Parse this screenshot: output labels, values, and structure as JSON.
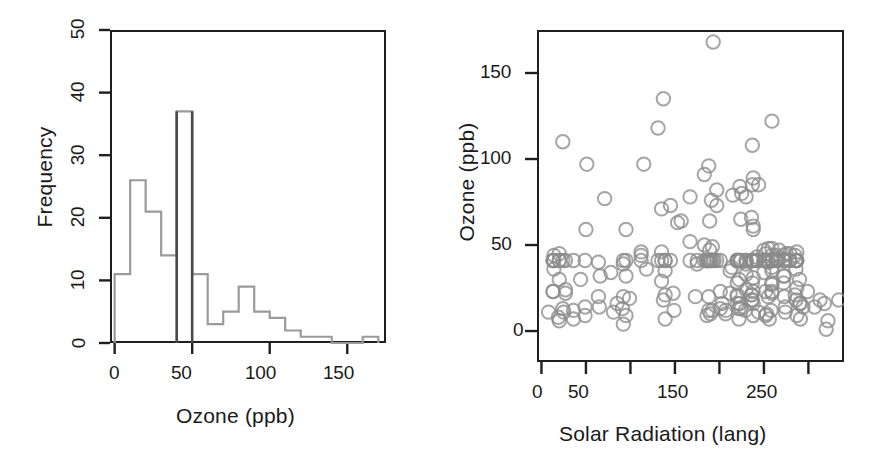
{
  "figure": {
    "width": 882,
    "height": 463,
    "background": "#ffffff",
    "panel_count": 2,
    "colors": {
      "frame": "#1f1f1f",
      "histogram_outline": "#9a9a9a",
      "histogram_highlight": "#4a4a4a",
      "scatter_point": "#8c8c8c",
      "text": "#1a1a1a"
    }
  },
  "panels": [
    {
      "id": "histogram",
      "position": "left"
    },
    {
      "id": "scatter",
      "position": "right"
    }
  ],
  "chart_data": [
    {
      "type": "bar",
      "id": "histogram",
      "title": "",
      "xlabel": "Ozone (ppb)",
      "ylabel": "Frequency",
      "xlim": [
        -3,
        175
      ],
      "ylim": [
        0,
        50
      ],
      "xticks": [
        0,
        50,
        100,
        150
      ],
      "xtick_labels": [
        "0",
        "50",
        "100",
        "150"
      ],
      "yticks": [
        0,
        10,
        20,
        30,
        40,
        50
      ],
      "ytick_labels": [
        "0",
        "10",
        "20",
        "30",
        "40",
        "50"
      ],
      "grid": false,
      "legend": "none",
      "bin_width": 10,
      "bin_edges": [
        0,
        10,
        20,
        30,
        40,
        50,
        60,
        70,
        80,
        90,
        100,
        110,
        120,
        130,
        140,
        150,
        160,
        170
      ],
      "categories": [
        "0-10",
        "10-20",
        "20-30",
        "30-40",
        "40-50",
        "50-60",
        "60-70",
        "70-80",
        "80-90",
        "90-100",
        "100-110",
        "110-120",
        "120-130",
        "130-140",
        "140-150",
        "150-160",
        "160-170"
      ],
      "values": [
        11,
        26,
        21,
        14,
        37,
        11,
        3,
        5,
        9,
        5,
        4,
        2,
        1,
        1,
        0,
        0,
        1
      ],
      "highlight_edges": [
        40,
        50
      ],
      "note": "Bin 40-50 drawn with darker outline (imputed mean bin)"
    },
    {
      "type": "scatter",
      "id": "scatter",
      "title": "",
      "xlabel": "Solar Radiation (lang)",
      "ylabel": "Ozone (ppb)",
      "xlim": [
        -5,
        340
      ],
      "ylim": [
        -18,
        175
      ],
      "xticks": [
        0,
        50,
        100,
        150,
        200,
        250,
        300
      ],
      "xtick_labels": [
        "0",
        "50",
        "",
        "150",
        "",
        "250",
        ""
      ],
      "yticks": [
        0,
        50,
        100,
        150
      ],
      "ytick_labels": [
        "0",
        "50",
        "100",
        "150"
      ],
      "grid": false,
      "legend": "none",
      "marker": "open-circle",
      "marker_size": 9,
      "points": [
        [
          190,
          41
        ],
        [
          118,
          36
        ],
        [
          149,
          12
        ],
        [
          313,
          18
        ],
        [
          186,
          41
        ],
        [
          220,
          28
        ],
        [
          299,
          23
        ],
        [
          99,
          19
        ],
        [
          19,
          8
        ],
        [
          194,
          41
        ],
        [
          256,
          7
        ],
        [
          290,
          16
        ],
        [
          274,
          11
        ],
        [
          65,
          14
        ],
        [
          334,
          18
        ],
        [
          307,
          14
        ],
        [
          78,
          34
        ],
        [
          322,
          6
        ],
        [
          44,
          30
        ],
        [
          8,
          11
        ],
        [
          320,
          1
        ],
        [
          25,
          11
        ],
        [
          92,
          4
        ],
        [
          66,
          32
        ],
        [
          266,
          41
        ],
        [
          13,
          23
        ],
        [
          252,
          45
        ],
        [
          223,
          41
        ],
        [
          279,
          41
        ],
        [
          286,
          41
        ],
        [
          287,
          41
        ],
        [
          242,
          41
        ],
        [
          186,
          41
        ],
        [
          220,
          41
        ],
        [
          264,
          41
        ],
        [
          273,
          41
        ],
        [
          286,
          41
        ],
        [
          242,
          41
        ],
        [
          186,
          41
        ],
        [
          220,
          41
        ],
        [
          13,
          41
        ],
        [
          252,
          41
        ],
        [
          223,
          41
        ],
        [
          279,
          41
        ],
        [
          286,
          41
        ],
        [
          287,
          41
        ],
        [
          242,
          41
        ],
        [
          186,
          41
        ],
        [
          220,
          41
        ],
        [
          264,
          41
        ],
        [
          273,
          41
        ],
        [
          135,
          41
        ],
        [
          13,
          41
        ],
        [
          36,
          41
        ],
        [
          255,
          41
        ],
        [
          175,
          41
        ],
        [
          139,
          41
        ],
        [
          20,
          41
        ],
        [
          259,
          41
        ],
        [
          250,
          41
        ],
        [
          135,
          29
        ],
        [
          230,
          41
        ],
        [
          259,
          41
        ],
        [
          250,
          41
        ],
        [
          135,
          71
        ],
        [
          230,
          39
        ],
        [
          259,
          23
        ],
        [
          236,
          21
        ],
        [
          259,
          37
        ],
        [
          255,
          20
        ],
        [
          207,
          12
        ],
        [
          222,
          13
        ],
        [
          137,
          135
        ],
        [
          192,
          49
        ],
        [
          273,
          32
        ],
        [
          157,
          64
        ],
        [
          64,
          40
        ],
        [
          71,
          77
        ],
        [
          51,
          97
        ],
        [
          115,
          97
        ],
        [
          244,
          85
        ],
        [
          190,
          10
        ],
        [
          259,
          27
        ],
        [
          36,
          7
        ],
        [
          255,
          48
        ],
        [
          212,
          35
        ],
        [
          238,
          61
        ],
        [
          215,
          79
        ],
        [
          153,
          63
        ],
        [
          203,
          16
        ],
        [
          225,
          80
        ],
        [
          237,
          108
        ],
        [
          188,
          20
        ],
        [
          167,
          52
        ],
        [
          197,
          82
        ],
        [
          183,
          50
        ],
        [
          189,
          64
        ],
        [
          95,
          59
        ],
        [
          92,
          39
        ],
        [
          252,
          9
        ],
        [
          220,
          16
        ],
        [
          230,
          78
        ],
        [
          259,
          35
        ],
        [
          236,
          66
        ],
        [
          259,
          122
        ],
        [
          238,
          89
        ],
        [
          24,
          110
        ],
        [
          112,
          44
        ],
        [
          237,
          28
        ],
        [
          224,
          65
        ],
        [
          27,
          22
        ],
        [
          238,
          59
        ],
        [
          201,
          23
        ],
        [
          238,
          31
        ],
        [
          14,
          44
        ],
        [
          139,
          21
        ],
        [
          49,
          9
        ],
        [
          20,
          45
        ],
        [
          193,
          168
        ],
        [
          145,
          73
        ],
        [
          191,
          76
        ],
        [
          131,
          118
        ],
        [
          223,
          84
        ],
        [
          237,
          85
        ],
        [
          188,
          96
        ],
        [
          167,
          78
        ],
        [
          197,
          73
        ],
        [
          183,
          91
        ],
        [
          189,
          47
        ],
        [
          95,
          32
        ],
        [
          92,
          20
        ],
        [
          252,
          23
        ],
        [
          220,
          21
        ],
        [
          230,
          24
        ],
        [
          259,
          44
        ],
        [
          236,
          21
        ],
        [
          259,
          28
        ],
        [
          238,
          9
        ],
        [
          24,
          13
        ],
        [
          112,
          46
        ],
        [
          237,
          18
        ],
        [
          224,
          13
        ],
        [
          27,
          24
        ],
        [
          238,
          16
        ],
        [
          201,
          13
        ],
        [
          238,
          23
        ],
        [
          14,
          36
        ],
        [
          139,
          7
        ],
        [
          49,
          14
        ],
        [
          20,
          30
        ],
        [
          193,
          41
        ],
        [
          145,
          41
        ],
        [
          191,
          41
        ],
        [
          131,
          41
        ],
        [
          223,
          41
        ],
        [
          237,
          41
        ],
        [
          188,
          41
        ],
        [
          167,
          41
        ],
        [
          197,
          41
        ],
        [
          183,
          41
        ],
        [
          189,
          41
        ],
        [
          95,
          41
        ],
        [
          92,
          41
        ],
        [
          252,
          41
        ],
        [
          220,
          41
        ],
        [
          230,
          41
        ],
        [
          259,
          41
        ],
        [
          236,
          41
        ],
        [
          259,
          41
        ],
        [
          238,
          41
        ],
        [
          24,
          41
        ],
        [
          112,
          41
        ],
        [
          237,
          41
        ],
        [
          224,
          41
        ],
        [
          27,
          41
        ],
        [
          238,
          41
        ],
        [
          201,
          41
        ],
        [
          238,
          41
        ],
        [
          14,
          41
        ],
        [
          139,
          41
        ],
        [
          49,
          41
        ],
        [
          20,
          41
        ],
        [
          229,
          12
        ],
        [
          91,
          13
        ],
        [
          81,
          11
        ],
        [
          13,
          23
        ],
        [
          50,
          59
        ],
        [
          85,
          16
        ],
        [
          286,
          18
        ],
        [
          64,
          20
        ],
        [
          285,
          44
        ],
        [
          222,
          30
        ],
        [
          259,
          48
        ],
        [
          274,
          42
        ],
        [
          285,
          21
        ],
        [
          173,
          20
        ],
        [
          148,
          22
        ],
        [
          236,
          18
        ],
        [
          291,
          16
        ],
        [
          294,
          14
        ],
        [
          275,
          45
        ],
        [
          287,
          46
        ],
        [
          290,
          30
        ],
        [
          318,
          16
        ],
        [
          214,
          37
        ],
        [
          250,
          34
        ],
        [
          274,
          14
        ],
        [
          253,
          10
        ],
        [
          272,
          28
        ],
        [
          244,
          11
        ],
        [
          287,
          9
        ],
        [
          291,
          7
        ],
        [
          95,
          9
        ],
        [
          188,
          12
        ],
        [
          267,
          47
        ],
        [
          272,
          32
        ],
        [
          212,
          22
        ],
        [
          258,
          12
        ],
        [
          264,
          44
        ],
        [
          223,
          16
        ],
        [
          279,
          45
        ],
        [
          286,
          36
        ],
        [
          287,
          25
        ],
        [
          242,
          43
        ],
        [
          186,
          9
        ],
        [
          220,
          20
        ],
        [
          264,
          42
        ],
        [
          273,
          44
        ],
        [
          135,
          46
        ],
        [
          230,
          33
        ],
        [
          259,
          22
        ],
        [
          250,
          47
        ],
        [
          20,
          6
        ],
        [
          36,
          12
        ],
        [
          255,
          40
        ],
        [
          175,
          39
        ],
        [
          139,
          35
        ],
        [
          207,
          10
        ],
        [
          222,
          7
        ],
        [
          137,
          18
        ],
        [
          192,
          12
        ],
        [
          273,
          20
        ]
      ],
      "n_points": 240,
      "note": "Horizontal band of identical Ozone ~41 values (imputed mean) across full Solar Radiation range"
    }
  ]
}
